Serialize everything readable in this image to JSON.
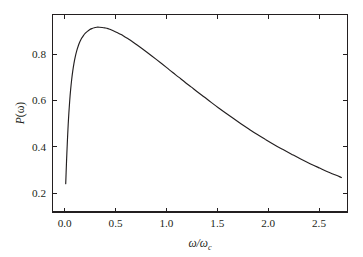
{
  "chart_data": {
    "type": "line",
    "title": "",
    "subtitle": "",
    "xlabel": "ω/ω",
    "xlabel_subscript": "c",
    "ylabel": "P(ω)",
    "xlim": [
      -0.12,
      2.78
    ],
    "ylim": [
      0.118,
      0.972
    ],
    "xticks": [
      0.0,
      0.5,
      1.0,
      1.5,
      2.0,
      2.5
    ],
    "xtick_labels": [
      "0.0",
      "0.5",
      "1.0",
      "1.5",
      "2.0",
      "2.5"
    ],
    "yticks": [
      0.2,
      0.4,
      0.6,
      0.8
    ],
    "ytick_labels": [
      "0.2",
      "0.4",
      "0.6",
      "0.8"
    ],
    "grid": false,
    "legend": null,
    "tick_direction": "in",
    "frame": "full-box",
    "line_color": "#231f20",
    "background_color": "#ffffff",
    "series": [
      {
        "name": "P(ω)",
        "x": [
          0.01,
          0.014,
          0.018,
          0.023,
          0.028,
          0.034,
          0.041,
          0.049,
          0.058,
          0.068,
          0.079,
          0.091,
          0.104,
          0.118,
          0.133,
          0.149,
          0.166,
          0.184,
          0.203,
          0.223,
          0.244,
          0.266,
          0.29,
          0.315,
          0.341,
          0.368,
          0.396,
          0.425,
          0.455,
          0.487,
          0.52,
          0.555,
          0.592,
          0.63,
          0.67,
          0.712,
          0.756,
          0.802,
          0.85,
          0.9,
          0.952,
          1.006,
          1.062,
          1.12,
          1.18,
          1.242,
          1.306,
          1.372,
          1.44,
          1.51,
          1.582,
          1.656,
          1.732,
          1.81,
          1.89,
          1.972,
          2.056,
          2.142,
          2.23,
          2.32,
          2.412,
          2.506,
          2.602,
          2.7,
          2.72
        ],
        "y": [
          0.24,
          0.29,
          0.338,
          0.39,
          0.441,
          0.494,
          0.547,
          0.598,
          0.646,
          0.689,
          0.727,
          0.761,
          0.79,
          0.815,
          0.836,
          0.854,
          0.869,
          0.881,
          0.891,
          0.899,
          0.906,
          0.911,
          0.915,
          0.917,
          0.917,
          0.916,
          0.914,
          0.911,
          0.906,
          0.9,
          0.893,
          0.885,
          0.875,
          0.865,
          0.853,
          0.84,
          0.826,
          0.811,
          0.795,
          0.778,
          0.76,
          0.741,
          0.721,
          0.701,
          0.68,
          0.659,
          0.637,
          0.615,
          0.592,
          0.569,
          0.546,
          0.523,
          0.5,
          0.477,
          0.454,
          0.432,
          0.41,
          0.389,
          0.368,
          0.347,
          0.327,
          0.308,
          0.289,
          0.271,
          0.267
        ]
      }
    ],
    "annotations": {
      "peak_x": 0.29,
      "peak_y": 0.92,
      "start_x": 0.01,
      "start_y": 0.24,
      "end_x": 2.72,
      "end_y": 0.17
    }
  },
  "axes": {
    "x_title_main": "ω/ω",
    "x_title_sub": "c",
    "y_title": "P(ω)"
  }
}
